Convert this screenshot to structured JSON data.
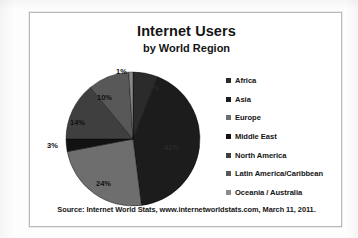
{
  "chart_data": {
    "type": "pie",
    "title": "Internet Users",
    "subtitle": "by World Region",
    "categories": [
      "Africa",
      "Asia",
      "Europe",
      "Middle East",
      "North America",
      "Latin America/Caribbean",
      "Oceania / Australia"
    ],
    "values": [
      6,
      42,
      24,
      3,
      14,
      10,
      1
    ],
    "value_labels": [
      "6%",
      "42%",
      "24%",
      "3%",
      "14%",
      "10%",
      "1%"
    ],
    "units": "percent",
    "legend_position": "right",
    "grid": false,
    "colors": [
      "#2b2b2b",
      "#1c1c1c",
      "#6e6e6e",
      "#121212",
      "#3f3f3f",
      "#585858",
      "#8a8a8a"
    ],
    "slice_label_positions": [
      {
        "label": "6%",
        "x": 104,
        "y": 18,
        "dark": true
      },
      {
        "label": "42%",
        "x": 120,
        "y": 78,
        "dark": true
      },
      {
        "label": "24%",
        "x": 52,
        "y": 114,
        "dark": false
      },
      {
        "label": "3%",
        "x": 3,
        "y": 76,
        "dark": false
      },
      {
        "label": "14%",
        "x": 26,
        "y": 53,
        "dark": false
      },
      {
        "label": "10%",
        "x": 53,
        "y": 28,
        "dark": false
      },
      {
        "label": "1%",
        "x": 72,
        "y": 2,
        "dark": false
      }
    ]
  },
  "chart": {
    "title": "Internet Users",
    "subtitle": "by World Region"
  },
  "legend": {
    "items": [
      {
        "label": "Africa",
        "color": "#2b2b2b"
      },
      {
        "label": "Asia",
        "color": "#1c1c1c"
      },
      {
        "label": "Europe",
        "color": "#6e6e6e"
      },
      {
        "label": "Middle East",
        "color": "#121212"
      },
      {
        "label": "North America",
        "color": "#3f3f3f"
      },
      {
        "label": "Latin America/Caribbean",
        "color": "#585858"
      },
      {
        "label": "Oceania / Australia",
        "color": "#8a8a8a"
      }
    ]
  },
  "footer": {
    "source": "Source: Internet World Stats, www.internetworldstats.com,  March 11, 2011."
  }
}
